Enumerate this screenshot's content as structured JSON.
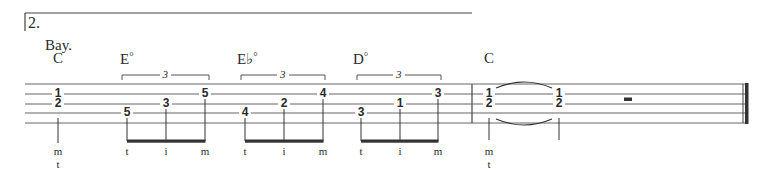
{
  "score": {
    "ending_number": "2.",
    "lyric": "Bay.",
    "chords": [
      {
        "root": "C",
        "quality": "",
        "x": 53
      },
      {
        "root": "E",
        "quality": "°",
        "x": 120
      },
      {
        "root": "E♭",
        "quality": "°",
        "x": 237
      },
      {
        "root": "D",
        "quality": "°",
        "x": 353
      },
      {
        "root": "C",
        "quality": "",
        "x": 484
      }
    ],
    "tuplets": [
      {
        "label": "3",
        "x1": 122,
        "x2": 209
      },
      {
        "label": "3",
        "x1": 241,
        "x2": 325
      },
      {
        "label": "3",
        "x1": 357,
        "x2": 441
      }
    ],
    "notes": [
      {
        "fret": "1",
        "string": 2,
        "x": 58
      },
      {
        "fret": "2",
        "string": 3,
        "x": 58
      },
      {
        "fret": "5",
        "string": 4,
        "x": 127
      },
      {
        "fret": "3",
        "string": 3,
        "x": 166
      },
      {
        "fret": "5",
        "string": 2,
        "x": 205
      },
      {
        "fret": "4",
        "string": 4,
        "x": 245
      },
      {
        "fret": "2",
        "string": 3,
        "x": 284
      },
      {
        "fret": "4",
        "string": 2,
        "x": 323
      },
      {
        "fret": "3",
        "string": 4,
        "x": 361
      },
      {
        "fret": "1",
        "string": 3,
        "x": 400
      },
      {
        "fret": "3",
        "string": 2,
        "x": 438
      },
      {
        "fret": "1",
        "string": 2,
        "x": 489
      },
      {
        "fret": "2",
        "string": 3,
        "x": 489
      },
      {
        "fret": "1",
        "string": 2,
        "x": 559
      },
      {
        "fret": "2",
        "string": 3,
        "x": 559
      }
    ],
    "fingerings": [
      {
        "label": "m",
        "x": 58,
        "row": 0
      },
      {
        "label": "t",
        "x": 58,
        "row": 1
      },
      {
        "label": "t",
        "x": 127,
        "row": 0
      },
      {
        "label": "i",
        "x": 166,
        "row": 0
      },
      {
        "label": "m",
        "x": 205,
        "row": 0
      },
      {
        "label": "t",
        "x": 245,
        "row": 0
      },
      {
        "label": "i",
        "x": 284,
        "row": 0
      },
      {
        "label": "m",
        "x": 323,
        "row": 0
      },
      {
        "label": "t",
        "x": 361,
        "row": 0
      },
      {
        "label": "i",
        "x": 400,
        "row": 0
      },
      {
        "label": "m",
        "x": 438,
        "row": 0
      },
      {
        "label": "m",
        "x": 489,
        "row": 0
      },
      {
        "label": "t",
        "x": 489,
        "row": 1
      }
    ],
    "rest": {
      "type": "half-rest",
      "x": 624
    },
    "colors": {
      "ink": "#2a2a2a",
      "staff": "#555555",
      "paper": "#ffffff"
    }
  }
}
